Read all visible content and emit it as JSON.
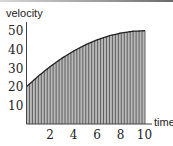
{
  "chart_data": {
    "type": "area",
    "title": "",
    "xlabel": "time",
    "ylabel": "velocity",
    "xlim": [
      0,
      10
    ],
    "ylim": [
      0,
      50
    ],
    "x_ticks": [
      "2",
      "4",
      "6",
      "8",
      "10"
    ],
    "y_ticks": [
      "10",
      "20",
      "30",
      "40",
      "50"
    ],
    "grid": false,
    "legend": null,
    "function_description": "v(t) = 50 - 0.3*(t - 10)^2, shaded area under curve with thin vertical rectangles (Riemann sum)",
    "subintervals": 40,
    "x": [
      0,
      1,
      2,
      3,
      4,
      5,
      6,
      7,
      8,
      9,
      10
    ],
    "values": [
      20,
      25.7,
      30.8,
      35.3,
      39.2,
      42.5,
      45.2,
      47.3,
      48.8,
      49.7,
      50
    ],
    "colors": {
      "fill": "#b8b8b8",
      "stripes": "#555555",
      "curve": "#222222",
      "axis": "#444444"
    }
  },
  "labels": {
    "ylabel": "velocity",
    "xlabel": "time",
    "y_ticks": [
      "50",
      "40",
      "30",
      "20",
      "10"
    ],
    "x_ticks": [
      "2",
      "4",
      "6",
      "8",
      "10"
    ]
  }
}
